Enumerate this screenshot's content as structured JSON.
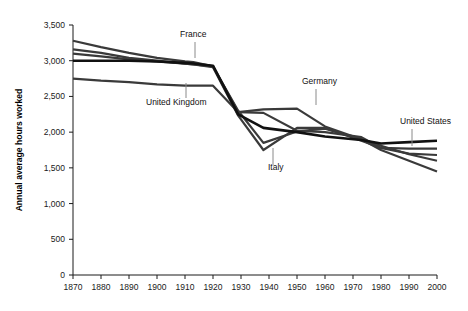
{
  "chart_data": {
    "type": "line",
    "title": "",
    "subtitle": "",
    "xlabel": "",
    "ylabel": "Annual average hours worked",
    "xlim": [
      1870,
      2000
    ],
    "ylim": [
      0,
      3500
    ],
    "grid": false,
    "legend_position": "inline-annotations",
    "x_ticks": [
      1870,
      1880,
      1890,
      1900,
      1910,
      1920,
      1930,
      1940,
      1950,
      1960,
      1970,
      1980,
      1990,
      2000
    ],
    "y_ticks": [
      0,
      500,
      1000,
      1500,
      2000,
      2500,
      3000,
      3500
    ],
    "y_tick_labels": [
      "0",
      "500",
      "1,000",
      "1,500",
      "2,000",
      "2,500",
      "3,000",
      "3,500"
    ],
    "x": [
      1870,
      1880,
      1890,
      1900,
      1910,
      1913,
      1920,
      1929,
      1938,
      1950,
      1960,
      1973,
      1980,
      1990,
      2000
    ],
    "series": [
      {
        "name": "France",
        "color": "#3a3a3a",
        "width": 2.2,
        "values": [
          3280,
          3190,
          3110,
          3040,
          2990,
          2980,
          2920,
          2300,
          1850,
          2010,
          2050,
          1900,
          1810,
          1690,
          1600
        ]
      },
      {
        "name": "Germany",
        "color": "#3a3a3a",
        "width": 2.2,
        "values": [
          3160,
          3110,
          3040,
          3000,
          2960,
          2950,
          2920,
          2280,
          2320,
          2330,
          2080,
          1900,
          1750,
          1600,
          1450
        ]
      },
      {
        "name": "Italy",
        "color": "#3a3a3a",
        "width": 2.2,
        "values": [
          3100,
          3060,
          3020,
          2990,
          2960,
          2950,
          2910,
          2230,
          1750,
          2060,
          2060,
          1880,
          1780,
          1700,
          1680
        ]
      },
      {
        "name": "United Kingdom",
        "color": "#3a3a3a",
        "width": 2.2,
        "values": [
          2750,
          2720,
          2700,
          2670,
          2650,
          2650,
          2650,
          2280,
          2270,
          2020,
          2000,
          1930,
          1780,
          1770,
          1770
        ]
      },
      {
        "name": "United States",
        "color": "#111111",
        "width": 2.6,
        "values": [
          3000,
          3000,
          3000,
          2990,
          2970,
          2960,
          2930,
          2250,
          2060,
          2000,
          1940,
          1890,
          1840,
          1860,
          1880
        ]
      }
    ],
    "annotations": [
      {
        "label": "France",
        "label_x": 180,
        "label_y": 37,
        "leader_x": 195,
        "leader_y1": 42,
        "leader_y2": 58
      },
      {
        "label": "United Kingdom",
        "label_x": 146,
        "label_y": 105,
        "leader_x": 186,
        "leader_y1": 98,
        "leader_y2": 83
      },
      {
        "label": "Germany",
        "label_x": 302,
        "label_y": 84,
        "leader_x": 316,
        "leader_y1": 89,
        "leader_y2": 105
      },
      {
        "label": "Italy",
        "label_x": 268,
        "label_y": 170,
        "leader_x": 273,
        "leader_y1": 165,
        "leader_y2": 148
      },
      {
        "label": "United States",
        "label_x": 400,
        "label_y": 124,
        "leader_x": 412,
        "leader_y1": 129,
        "leader_y2": 146
      }
    ]
  }
}
